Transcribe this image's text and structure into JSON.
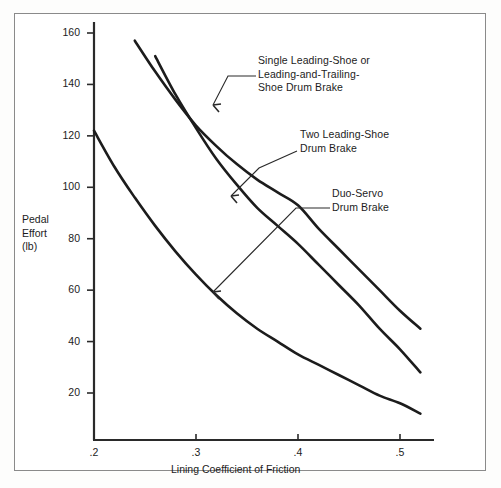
{
  "chart_data": {
    "type": "line",
    "title": "",
    "xlabel": "Lining Coefficient of Friction",
    "ylabel": "Pedal Effort (lb)",
    "ylabel_lines": [
      "Pedal",
      "Effort",
      "(lb)"
    ],
    "xlim": [
      0.2,
      0.53
    ],
    "ylim": [
      0,
      172
    ],
    "grid": false,
    "legend": "inline-annotations",
    "xticks": [
      0.2,
      0.3,
      0.4,
      0.5
    ],
    "xtick_labels": [
      ".2",
      ".3",
      ".4",
      ".5"
    ],
    "yticks": [
      20,
      40,
      60,
      80,
      100,
      120,
      140,
      160
    ],
    "ytick_labels": [
      "20",
      "40",
      "60",
      "80",
      "100",
      "120",
      "140",
      "160"
    ],
    "series": [
      {
        "name": "Single Leading-Shoe or Leading-and-Trailing-Shoe Drum Brake",
        "x": [
          0.215,
          0.24,
          0.26,
          0.28,
          0.3,
          0.32,
          0.34,
          0.36,
          0.38,
          0.4,
          0.42,
          0.44,
          0.46,
          0.48,
          0.5,
          0.52
        ],
        "values": [
          172,
          157,
          145,
          134,
          124,
          116,
          109,
          103,
          98,
          93,
          84,
          76,
          68,
          60,
          52,
          45
        ]
      },
      {
        "name": "Two Leading-Shoe Drum Brake",
        "x": [
          0.235,
          0.26,
          0.28,
          0.3,
          0.32,
          0.34,
          0.36,
          0.38,
          0.4,
          0.42,
          0.44,
          0.46,
          0.48,
          0.5,
          0.52
        ],
        "values": [
          172,
          151,
          136,
          123,
          111,
          101,
          92,
          85,
          78,
          70,
          62,
          54,
          45,
          37,
          28
        ]
      },
      {
        "name": "Duo-Servo Drum Brake",
        "x": [
          0.2,
          0.22,
          0.24,
          0.26,
          0.28,
          0.3,
          0.32,
          0.34,
          0.36,
          0.38,
          0.4,
          0.42,
          0.44,
          0.46,
          0.48,
          0.5,
          0.52
        ],
        "values": [
          122,
          108,
          96,
          85,
          75,
          66,
          58,
          51,
          45,
          40,
          35,
          31,
          27,
          23,
          19,
          16,
          12
        ]
      }
    ],
    "annotations": [
      {
        "id": "single",
        "lines": [
          "Single Leading-Shoe or",
          "Leading-and-Trailing-",
          "Shoe Drum Brake"
        ],
        "points_to_series": "Single Leading-Shoe or Leading-and-Trailing-Shoe Drum Brake"
      },
      {
        "id": "two",
        "lines": [
          "Two Leading-Shoe",
          "Drum Brake"
        ],
        "points_to_series": "Two Leading-Shoe Drum Brake"
      },
      {
        "id": "duo",
        "lines": [
          "Duo-Servo",
          "Drum Brake"
        ],
        "points_to_series": "Duo-Servo Drum Brake"
      }
    ]
  },
  "axes": {
    "ytick_0": "20",
    "ytick_1": "40",
    "ytick_2": "60",
    "ytick_3": "80",
    "ytick_4": "100",
    "ytick_5": "120",
    "ytick_6": "140",
    "ytick_7": "160",
    "xtick_0": ".2",
    "xtick_1": ".3",
    "xtick_2": ".4",
    "xtick_3": ".5",
    "ylabel_line_1": "Pedal",
    "ylabel_line_2": "Effort",
    "ylabel_line_3": "(lb)",
    "xlabel": "Lining Coefficient of Friction"
  },
  "annotations": {
    "single_line_1": "Single Leading-Shoe or",
    "single_line_2": "Leading-and-Trailing-",
    "single_line_3": "Shoe Drum Brake",
    "two_line_1": "Two Leading-Shoe",
    "two_line_2": "Drum Brake",
    "duo_line_1": "Duo-Servo",
    "duo_line_2": "Drum Brake"
  },
  "colors": {
    "curve": "#1c1c1c",
    "axis": "#2a2a2a",
    "text": "#1c1c1c",
    "frame": "#8a8a8a",
    "background": "#ffffff"
  }
}
